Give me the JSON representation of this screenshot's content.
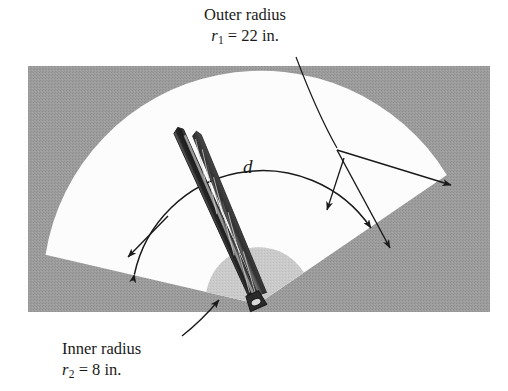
{
  "figure": {
    "title_alt": "Windshield wiper swept area diagram",
    "labels": {
      "outer": {
        "line1": "Outer radius",
        "var": "r",
        "sub": "1",
        "value": "= 22 in."
      },
      "inner": {
        "line1": "Inner radius",
        "var": "r",
        "sub": "2",
        "value": "= 8 in."
      },
      "sweep": {
        "symbol": "d"
      }
    },
    "colors": {
      "background_panel": "#9a9a9a",
      "swept_sector": "#fcfcfc",
      "inner_disc": "#c9c9c9",
      "ink": "#1a1a1a",
      "blade_dark": "#2b2b2b",
      "blade_mid": "#6e6e6e",
      "page": "#ffffff"
    },
    "geometry": {
      "panel": {
        "x": 28,
        "y": 66,
        "width": 462,
        "height": 246
      },
      "pivot": {
        "x": 258,
        "y": 304
      },
      "outer_radius_px": 218,
      "inner_radius_px": 53,
      "sweep_start_deg": 193,
      "sweep_end_deg": 330,
      "arc_d_radius_px": 131
    }
  }
}
